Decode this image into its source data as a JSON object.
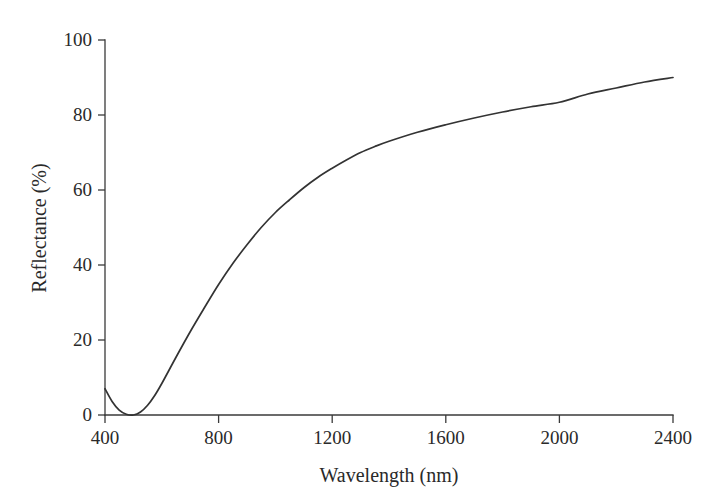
{
  "chart_data": {
    "type": "line",
    "title": "",
    "subtitle": "",
    "xlabel": "Wavelength (nm)",
    "ylabel": "Reflectance (%)",
    "xlim": [
      400,
      2400
    ],
    "ylim": [
      0,
      100
    ],
    "xticks": [
      400,
      800,
      1200,
      1600,
      2000,
      2400
    ],
    "yticks": [
      0,
      20,
      40,
      60,
      80,
      100
    ],
    "xtick_labels": [
      "400",
      "800",
      "1200",
      "1600",
      "2000",
      "2400"
    ],
    "ytick_labels": [
      "0",
      "20",
      "40",
      "60",
      "80",
      "100"
    ],
    "grid": false,
    "legend": false,
    "legend_position": "none",
    "annotations": [],
    "series": [
      {
        "name": "Reflectance spectrum",
        "color": "#333333",
        "line_width": 1.7,
        "x": [
          400,
          425,
          450,
          475,
          500,
          525,
          550,
          575,
          600,
          650,
          700,
          750,
          800,
          850,
          900,
          950,
          1000,
          1050,
          1100,
          1150,
          1200,
          1250,
          1300,
          1350,
          1400,
          1500,
          1600,
          1700,
          1800,
          1900,
          2000,
          2100,
          2200,
          2300,
          2400
        ],
        "y": [
          7.0,
          3.6,
          1.3,
          0.2,
          0.0,
          0.8,
          2.6,
          5.2,
          8.4,
          15.4,
          22.2,
          28.6,
          34.8,
          40.4,
          45.4,
          50.0,
          54.0,
          57.4,
          60.6,
          63.4,
          65.8,
          68.0,
          70.0,
          71.6,
          73.0,
          75.4,
          77.4,
          79.2,
          80.8,
          82.2,
          83.4,
          85.6,
          87.2,
          88.8,
          90.0
        ]
      }
    ]
  },
  "axes": {
    "x_axis_name": "wavelength-axis",
    "y_axis_name": "reflectance-axis"
  },
  "colors": {
    "curve": "#333333",
    "axis": "#3a3a3a",
    "text": "#2a2a2a",
    "background": "#ffffff"
  }
}
